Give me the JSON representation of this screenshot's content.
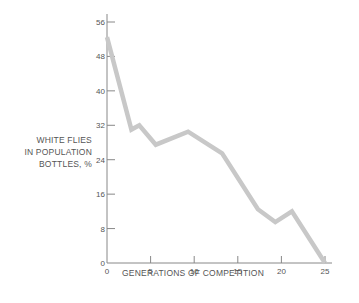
{
  "chart_data": {
    "type": "line",
    "title": "",
    "xlabel": "GENERATIONS OF COMPETITION",
    "ylabel_lines": [
      "WHITE FLIES",
      "IN POPULATION",
      "BOTTLES, %"
    ],
    "ylabel": "WHITE FLIES IN POPULATION BOTTLES, %",
    "xlim": [
      0,
      25
    ],
    "ylim": [
      0,
      56
    ],
    "xticks": [
      0,
      5,
      10,
      15,
      20,
      25
    ],
    "yticks": [
      0,
      8,
      16,
      24,
      32,
      40,
      48,
      56
    ],
    "grid": false,
    "legend": null,
    "series": [
      {
        "name": "White flies",
        "color": "#c8c8c8",
        "x": [
          0,
          2.8,
          3.7,
          5.6,
          9.3,
          13.2,
          17.3,
          19.3,
          21.2,
          25
        ],
        "y": [
          52.5,
          31,
          32,
          27.5,
          30.5,
          25.5,
          12.5,
          9.5,
          12,
          0
        ]
      }
    ]
  },
  "style": {
    "axis_color": "#888888",
    "line_color": "#c8c8c8",
    "text_color": "#555555"
  }
}
